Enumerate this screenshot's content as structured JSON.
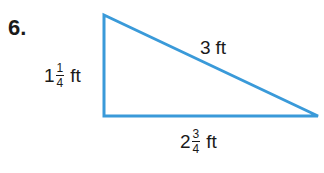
{
  "problem": {
    "number": "6."
  },
  "triangle": {
    "type": "right",
    "stroke_color": "#3a9ad9",
    "vertices": {
      "top": [
        104,
        15
      ],
      "right_angle": [
        104,
        116
      ],
      "right": [
        318,
        116
      ]
    },
    "sides": {
      "vertical": {
        "whole": "1",
        "numerator": "1",
        "denominator": "4",
        "unit": "ft",
        "text": "1 1/4 ft"
      },
      "hypotenuse": {
        "value": "3",
        "unit": "ft",
        "text": "3 ft"
      },
      "horizontal": {
        "whole": "2",
        "numerator": "3",
        "denominator": "4",
        "unit": "ft",
        "text": "2 3/4 ft"
      }
    }
  }
}
